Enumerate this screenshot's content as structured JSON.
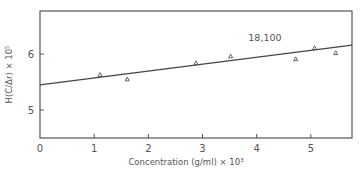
{
  "chart_data": {
    "type": "scatter",
    "title": "",
    "xlabel": "Concentration (g/ml) × 10³",
    "ylabel": "H(C/Δr) × 10⁵",
    "xlim": [
      0,
      5.76
    ],
    "ylim": [
      4.5,
      6.77
    ],
    "x_ticks": [
      0,
      1,
      2,
      3,
      4,
      5
    ],
    "x_tick_labels": [
      "0",
      "1",
      "2",
      "3",
      "4",
      "5"
    ],
    "y_ticks": [
      5,
      6
    ],
    "y_tick_labels": [
      "5",
      "6"
    ],
    "grid": false,
    "legend": null,
    "series": [
      {
        "name": "data",
        "marker": "triangle",
        "x": [
          1.11,
          1.61,
          2.88,
          3.52,
          4.72,
          5.07,
          5.46
        ],
        "y": [
          5.63,
          5.55,
          5.84,
          5.96,
          5.91,
          6.11,
          6.02
        ]
      },
      {
        "name": "fit",
        "type": "line",
        "x": [
          0,
          5.76
        ],
        "y": [
          5.45,
          6.16
        ]
      }
    ],
    "annotations": [
      {
        "text": "18,100",
        "x": 4.4,
        "y": 6.19
      }
    ]
  }
}
